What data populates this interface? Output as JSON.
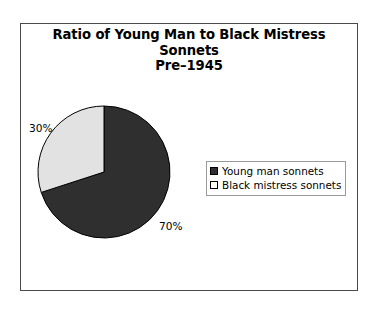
{
  "chart_data": {
    "type": "pie",
    "title": "Ratio of Young Man to Black Mistress Sonnets",
    "subtitle": "Pre–1945",
    "categories": [
      "Young man sonnets",
      "Black mistress sonnets"
    ],
    "values": [
      70,
      30
    ],
    "data_labels": [
      "70%",
      "30%"
    ],
    "colors": [
      "#2f2f2f",
      "#e2e2e2"
    ],
    "legend_position": "right",
    "start_angle_deg": 0,
    "direction": "clockwise",
    "grid": false,
    "xlabel": "",
    "ylabel": ""
  },
  "frame": {
    "border_color": "#4a4a4a"
  },
  "legend": {
    "items": [
      {
        "label": "Young man sonnets",
        "swatch": "filled"
      },
      {
        "label": "Black mistress sonnets",
        "swatch": "hollow"
      }
    ]
  }
}
